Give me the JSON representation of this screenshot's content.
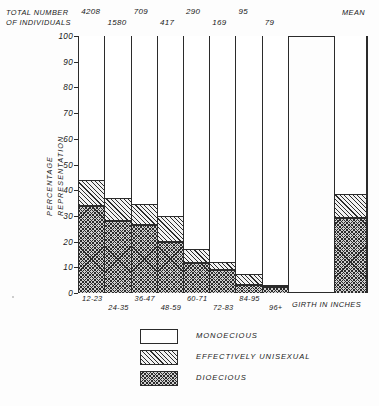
{
  "header": {
    "total_label_line1": "TOTAL NUMBER",
    "total_label_line2": "OF INDIVIDUALS",
    "mean_label": "MEAN"
  },
  "axes": {
    "y_title_line1": "PERCENTAGE",
    "y_title_line2": "REPRESENTATION",
    "x_title": "GIRTH IN INCHES",
    "y_ticks": [
      "0",
      "10",
      "20",
      "30",
      "40",
      "50",
      "60",
      "70",
      "80",
      "90",
      "100"
    ]
  },
  "legend": {
    "items": [
      {
        "label": "MONOECIOUS",
        "pattern": "white"
      },
      {
        "label": "EFFECTIVELY UNISEXUAL",
        "pattern": "diagonal-hatch"
      },
      {
        "label": "DIOECIOUS",
        "pattern": "cross-hatch"
      }
    ]
  },
  "chart_data": {
    "type": "bar",
    "title": "",
    "subtitle": "",
    "xlabel": "GIRTH IN INCHES",
    "ylabel": "PERCENTAGE REPRESENTATION",
    "ylim": [
      0,
      100
    ],
    "ytick_step": 10,
    "grid": false,
    "stacked": true,
    "legend_position": "below-plot",
    "categories": [
      "12-23",
      "24-35",
      "36-47",
      "48-59",
      "60-71",
      "72-83",
      "84-95",
      "96+",
      "MEAN"
    ],
    "sample_sizes": [
      "4208",
      "1580",
      "709",
      "417",
      "290",
      "169",
      "95",
      "79",
      ""
    ],
    "series": [
      {
        "name": "DIOECIOUS",
        "values": [
          34,
          28,
          26.5,
          20,
          11.5,
          9,
          3,
          2.5,
          29
        ]
      },
      {
        "name": "EFFECTIVELY UNISEXUAL",
        "values": [
          10,
          9,
          8,
          10,
          5.5,
          3,
          4.5,
          0.8,
          9.5
        ]
      },
      {
        "name": "MONOECIOUS",
        "values": [
          56,
          63,
          65.5,
          70,
          83,
          88,
          92.5,
          96.7,
          61.5
        ]
      }
    ],
    "cumulative_tops": {
      "dioecious": [
        34,
        28,
        26.5,
        20,
        11.5,
        9,
        3,
        2.5,
        29
      ],
      "unisexual": [
        44,
        37,
        34.5,
        30,
        17,
        12,
        7.5,
        3.3,
        38.5
      ]
    }
  }
}
